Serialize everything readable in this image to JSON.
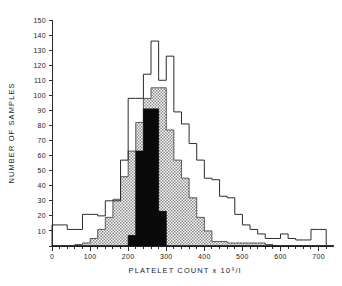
{
  "chart_data": {
    "type": "bar",
    "title": "",
    "subtitle": "",
    "xlabel": "PLATELET COUNT x 10⁹/l",
    "ylabel": "NUMBER OF SAMPLES",
    "xlim": [
      0,
      730
    ],
    "ylim": [
      0,
      150
    ],
    "bin_width": 20,
    "grid": false,
    "legend_position": "none",
    "xticks": [
      0,
      100,
      200,
      300,
      400,
      500,
      600,
      700
    ],
    "xtick_labels": [
      "0",
      "100",
      "200",
      "300",
      "400",
      "500",
      "600",
      "700"
    ],
    "xminorticks": [
      20,
      40,
      60,
      80,
      120,
      140,
      160,
      180,
      220,
      240,
      260,
      280,
      320,
      340,
      360,
      380,
      420,
      440,
      460,
      480,
      520,
      540,
      560,
      580,
      620,
      640,
      660,
      680,
      720
    ],
    "yticks": [
      0,
      10,
      20,
      30,
      40,
      50,
      60,
      70,
      80,
      90,
      100,
      110,
      120,
      130,
      140,
      150
    ],
    "ytick_labels": [
      "0",
      "10",
      "20",
      "30",
      "40",
      "50",
      "60",
      "70",
      "80",
      "90",
      "100",
      "110",
      "120",
      "130",
      "140",
      "150"
    ],
    "bin_edges": [
      0,
      20,
      40,
      60,
      80,
      100,
      120,
      140,
      160,
      180,
      200,
      220,
      240,
      260,
      280,
      300,
      320,
      340,
      360,
      380,
      400,
      420,
      440,
      460,
      480,
      500,
      520,
      540,
      560,
      580,
      600,
      620,
      640,
      660,
      680,
      700,
      720,
      740
    ],
    "series": [
      {
        "name": "all-samples-outline",
        "style": "open-outline",
        "color": "#2b2b2b",
        "values": [
          14,
          14,
          11,
          11,
          21,
          21,
          20,
          30,
          30,
          57,
          98,
          98,
          114,
          136,
          110,
          126,
          89,
          81,
          68,
          57,
          45,
          44,
          33,
          32,
          21,
          14,
          11,
          8,
          5,
          5,
          8,
          5,
          4,
          4,
          11,
          11,
          0
        ]
      },
      {
        "name": "hatched-subset",
        "style": "hatched",
        "color": "#4a4a4a",
        "values": [
          0,
          0,
          0,
          1,
          2,
          5,
          11,
          19,
          31,
          46,
          63,
          82,
          98,
          105,
          105,
          77,
          57,
          45,
          32,
          19,
          10,
          3,
          3,
          2,
          2,
          2,
          2,
          2,
          1,
          0,
          0,
          0,
          0,
          0,
          0,
          0,
          0
        ]
      },
      {
        "name": "solid-black-subset",
        "style": "solid",
        "color": "#0a0a0a",
        "values": [
          0,
          0,
          0,
          0,
          0,
          0,
          0,
          0,
          0,
          0,
          7,
          63,
          91,
          91,
          23,
          0,
          0,
          0,
          0,
          0,
          0,
          0,
          0,
          0,
          0,
          0,
          0,
          0,
          0,
          0,
          0,
          0,
          0,
          0,
          0,
          0,
          0
        ]
      }
    ]
  },
  "figure": {
    "background_color": "#ffffff",
    "axis_color": "#2b2b2b"
  }
}
